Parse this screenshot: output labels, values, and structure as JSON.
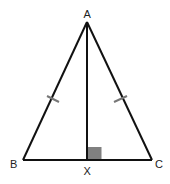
{
  "diagram": {
    "type": "isosceles-triangle-with-altitude",
    "colors": {
      "line": "#111111",
      "tick": "#777777",
      "right_angle_fill": "#808080",
      "label": "#222222",
      "background": "#ffffff"
    },
    "points": {
      "A": {
        "label": "A",
        "x": 87,
        "y": 22
      },
      "B": {
        "label": "B",
        "x": 23,
        "y": 160
      },
      "C": {
        "label": "C",
        "x": 152,
        "y": 160
      },
      "X": {
        "label": "X",
        "x": 87,
        "y": 160
      }
    },
    "segments": [
      {
        "name": "AB",
        "from": "A",
        "to": "B",
        "tick_marks": 1
      },
      {
        "name": "AC",
        "from": "A",
        "to": "C",
        "tick_marks": 1
      },
      {
        "name": "BC",
        "from": "B",
        "to": "C",
        "tick_marks": 0
      },
      {
        "name": "AX",
        "from": "A",
        "to": "X",
        "tick_marks": 0
      }
    ],
    "annotations": [
      {
        "type": "right-angle",
        "at": "X",
        "between": [
          "AX",
          "XC"
        ]
      },
      {
        "type": "congruence",
        "segments": [
          "AB",
          "AC"
        ]
      }
    ]
  }
}
